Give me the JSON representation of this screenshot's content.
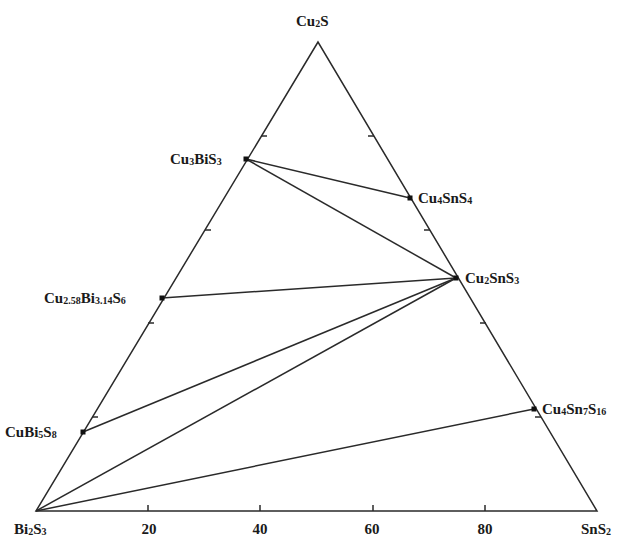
{
  "diagram": {
    "type": "ternary-phase-diagram",
    "vertices": {
      "top": {
        "label": "Cu2S",
        "parts": [
          [
            "Cu",
            ""
          ],
          [
            "2",
            "sub"
          ],
          [
            "S",
            ""
          ]
        ]
      },
      "bottom_left": {
        "label": "Bi2S3",
        "parts": [
          [
            "Bi",
            ""
          ],
          [
            "2",
            "sub"
          ],
          [
            "S",
            ""
          ],
          [
            "3",
            "sub"
          ]
        ]
      },
      "bottom_right": {
        "label": "SnS2",
        "parts": [
          [
            "SnS",
            ""
          ],
          [
            "2",
            "sub"
          ]
        ]
      }
    },
    "axis_ticks": [
      "20",
      "40",
      "60",
      "80"
    ],
    "phases": [
      {
        "id": "cu3bis3",
        "label": "Cu3BiS3",
        "parts": [
          [
            "Cu",
            ""
          ],
          [
            "3",
            "sub"
          ],
          [
            "BiS",
            ""
          ],
          [
            "3",
            "sub"
          ]
        ]
      },
      {
        "id": "cu4sns4",
        "label": "Cu4SnS4",
        "parts": [
          [
            "Cu",
            ""
          ],
          [
            "4",
            "sub"
          ],
          [
            "SnS",
            ""
          ],
          [
            "4",
            "sub"
          ]
        ]
      },
      {
        "id": "cu2sns3",
        "label": "Cu2SnS3",
        "parts": [
          [
            "Cu",
            ""
          ],
          [
            "2",
            "sub"
          ],
          [
            "SnS",
            ""
          ],
          [
            "3",
            "sub"
          ]
        ]
      },
      {
        "id": "cu258bi314s6",
        "label": "Cu2.58Bi3.14S6",
        "parts": [
          [
            "Cu",
            ""
          ],
          [
            "2.58",
            "sub"
          ],
          [
            "Bi",
            ""
          ],
          [
            "3.14",
            "sub"
          ],
          [
            "S",
            ""
          ],
          [
            "6",
            "sub"
          ]
        ]
      },
      {
        "id": "cubi5s8",
        "label": "CuBi5S8",
        "parts": [
          [
            "CuBi",
            ""
          ],
          [
            "5",
            "sub"
          ],
          [
            "S",
            ""
          ],
          [
            "8",
            "sub"
          ]
        ]
      },
      {
        "id": "cu4sn7s16",
        "label": "Cu4Sn7S16",
        "parts": [
          [
            "Cu",
            ""
          ],
          [
            "4",
            "sub"
          ],
          [
            "Sn",
            ""
          ],
          [
            "7",
            "sub"
          ],
          [
            "S",
            ""
          ],
          [
            "16",
            "sub"
          ]
        ]
      }
    ],
    "tie_lines": [
      [
        "Cu3BiS3",
        "Cu4SnS4"
      ],
      [
        "Cu3BiS3",
        "Cu2SnS3"
      ],
      [
        "Cu2.58Bi3.14S6",
        "Cu2SnS3"
      ],
      [
        "CuBi5S8",
        "Cu2SnS3"
      ],
      [
        "Bi2S3",
        "Cu2SnS3"
      ],
      [
        "Bi2S3",
        "Cu4Sn7S16"
      ]
    ],
    "line_color": "#2a2a2a"
  }
}
